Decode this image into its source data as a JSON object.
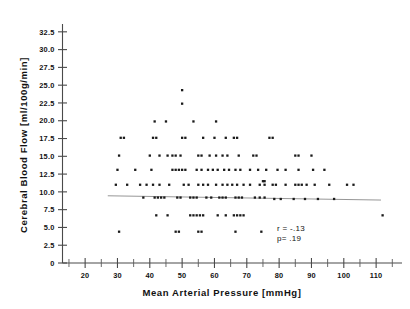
{
  "chart_data": {
    "type": "scatter",
    "title": "",
    "xlabel": "Mean Arterial Pressure  [mmHg]",
    "ylabel": "Cerebral Blood Flow  [ml/100g/min]",
    "xlim": [
      13,
      118
    ],
    "ylim": [
      0,
      33.6
    ],
    "grid": false,
    "legend": null,
    "x_ticks_major": [
      20,
      30,
      40,
      50,
      60,
      70,
      80,
      90,
      100,
      110
    ],
    "x_ticks_major_labels": [
      "20",
      "30",
      "40",
      "50",
      "60",
      "70",
      "80",
      "90",
      "100",
      "110"
    ],
    "x_ticks_minor": [
      15,
      25,
      35,
      45,
      55,
      65,
      75,
      85,
      95,
      105,
      115
    ],
    "y_ticks_major": [
      0,
      2.5,
      5.0,
      7.5,
      10.0,
      12.5,
      15.0,
      17.5,
      20.0,
      22.5,
      25.0,
      27.5,
      30.0,
      32.5
    ],
    "y_ticks_major_labels": [
      "0",
      "2.5",
      "5.0",
      "7.5",
      "10.0",
      "12.5",
      "15.0",
      "17.5",
      "20.0",
      "22.5",
      "25.0",
      "27.5",
      "30.0",
      "32.5"
    ],
    "annotations": [
      {
        "name": "correlation",
        "text": "r = -.13"
      },
      {
        "name": "p-value",
        "text": "p= .19"
      }
    ],
    "fit_line": {
      "name": "regression-line",
      "x_start": 27.0,
      "y_start": 9.45,
      "x_end": 111.5,
      "y_end": 8.85
    },
    "points": [
      [
        50,
        24.3
      ],
      [
        50,
        22.4
      ],
      [
        41.5,
        19.9
      ],
      [
        45,
        19.9
      ],
      [
        53.5,
        19.9
      ],
      [
        60.5,
        19.9
      ],
      [
        31,
        17.6
      ],
      [
        32,
        17.6
      ],
      [
        41,
        17.6
      ],
      [
        42,
        17.6
      ],
      [
        50,
        17.6
      ],
      [
        51,
        17.6
      ],
      [
        56.5,
        17.6
      ],
      [
        60,
        17.6
      ],
      [
        63.5,
        17.6
      ],
      [
        66,
        17.6
      ],
      [
        67,
        17.6
      ],
      [
        77,
        17.6
      ],
      [
        78,
        17.6
      ],
      [
        30.5,
        15.1
      ],
      [
        40,
        15.1
      ],
      [
        43,
        15.1
      ],
      [
        45.5,
        15.1
      ],
      [
        47,
        15.1
      ],
      [
        48,
        15.1
      ],
      [
        49.5,
        15.1
      ],
      [
        55,
        15.1
      ],
      [
        56,
        15.1
      ],
      [
        58.5,
        15.1
      ],
      [
        60.5,
        15.1
      ],
      [
        62.5,
        15.1
      ],
      [
        64,
        15.1
      ],
      [
        67.5,
        15.1
      ],
      [
        72,
        15.1
      ],
      [
        73,
        15.1
      ],
      [
        85,
        15.1
      ],
      [
        86,
        15.1
      ],
      [
        90,
        15.1
      ],
      [
        30,
        13.1
      ],
      [
        35.5,
        13.1
      ],
      [
        40.5,
        13.1
      ],
      [
        47,
        13.1
      ],
      [
        48,
        13.1
      ],
      [
        49,
        13.1
      ],
      [
        50,
        13.1
      ],
      [
        51,
        13.1
      ],
      [
        54.5,
        13.1
      ],
      [
        56,
        13.1
      ],
      [
        58,
        13.1
      ],
      [
        59.5,
        13.1
      ],
      [
        61,
        13.1
      ],
      [
        63,
        13.1
      ],
      [
        64.5,
        13.1
      ],
      [
        66.5,
        13.1
      ],
      [
        68,
        13.1
      ],
      [
        71,
        13.1
      ],
      [
        73.5,
        13.1
      ],
      [
        76,
        13.1
      ],
      [
        79.5,
        13.1
      ],
      [
        82,
        13.1
      ],
      [
        86,
        13.1
      ],
      [
        90.5,
        13.1
      ],
      [
        94,
        13.1
      ],
      [
        29.5,
        11.0
      ],
      [
        33,
        11.0
      ],
      [
        37,
        11.0
      ],
      [
        39,
        11.0
      ],
      [
        41,
        11.0
      ],
      [
        43,
        11.0
      ],
      [
        46,
        11.0
      ],
      [
        50.5,
        11.0
      ],
      [
        52,
        11.0
      ],
      [
        55,
        11.0
      ],
      [
        56.5,
        11.0
      ],
      [
        58,
        11.0
      ],
      [
        60.5,
        11.0
      ],
      [
        62.5,
        11.0
      ],
      [
        64,
        11.0
      ],
      [
        65.5,
        11.0
      ],
      [
        67,
        11.0
      ],
      [
        69,
        11.0
      ],
      [
        71,
        11.0
      ],
      [
        75,
        11.5
      ],
      [
        75.5,
        11.5
      ],
      [
        74,
        11.0
      ],
      [
        75.5,
        11.0
      ],
      [
        78,
        11.0
      ],
      [
        79,
        11.0
      ],
      [
        82,
        11.0
      ],
      [
        85,
        11.0
      ],
      [
        86,
        11.0
      ],
      [
        87,
        11.0
      ],
      [
        88.5,
        11.0
      ],
      [
        91,
        11.0
      ],
      [
        95.5,
        11.0
      ],
      [
        101,
        11.0
      ],
      [
        103,
        11.0
      ],
      [
        38,
        9.2
      ],
      [
        41.5,
        9.2
      ],
      [
        42.5,
        9.2
      ],
      [
        43.5,
        9.2
      ],
      [
        44.5,
        9.2
      ],
      [
        48.5,
        9.2
      ],
      [
        49.5,
        9.2
      ],
      [
        52.5,
        9.2
      ],
      [
        53.5,
        9.2
      ],
      [
        54.5,
        9.2
      ],
      [
        57.5,
        9.2
      ],
      [
        59,
        9.2
      ],
      [
        61.5,
        9.2
      ],
      [
        62.5,
        9.2
      ],
      [
        63.5,
        9.2
      ],
      [
        66.5,
        9.2
      ],
      [
        67.5,
        9.2
      ],
      [
        68.5,
        9.2
      ],
      [
        72.5,
        9.2
      ],
      [
        74,
        9.2
      ],
      [
        75.5,
        9.2
      ],
      [
        78.5,
        9.0
      ],
      [
        80.5,
        9.0
      ],
      [
        84.5,
        9.0
      ],
      [
        88,
        9.0
      ],
      [
        92,
        9.0
      ],
      [
        97,
        9.0
      ],
      [
        42,
        6.7
      ],
      [
        45.5,
        6.7
      ],
      [
        52.5,
        6.7
      ],
      [
        53.5,
        6.7
      ],
      [
        54.5,
        6.7
      ],
      [
        55.5,
        6.7
      ],
      [
        56.5,
        6.7
      ],
      [
        61,
        6.7
      ],
      [
        63.5,
        6.7
      ],
      [
        66,
        6.7
      ],
      [
        67,
        6.7
      ],
      [
        68,
        6.7
      ],
      [
        69,
        6.7
      ],
      [
        112,
        6.7
      ],
      [
        30.5,
        4.4
      ],
      [
        48,
        4.4
      ],
      [
        49,
        4.4
      ],
      [
        55,
        4.4
      ],
      [
        56,
        4.4
      ],
      [
        66.5,
        4.4
      ],
      [
        74.5,
        4.4
      ]
    ]
  }
}
